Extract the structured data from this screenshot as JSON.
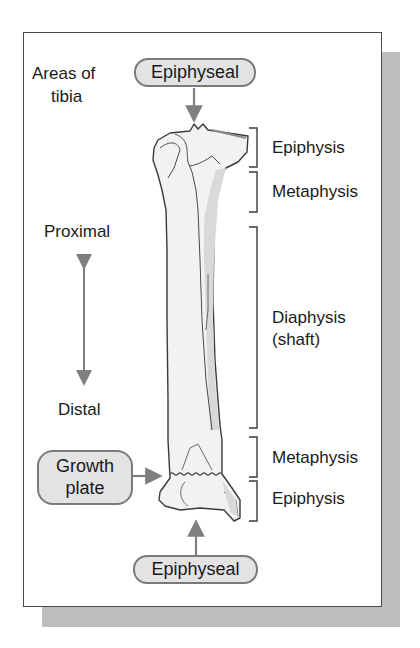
{
  "title_lines": [
    "Areas of",
    "tibia"
  ],
  "callouts": {
    "top": "Epiphyseal",
    "bottom": "Epiphyseal",
    "growth_plate_lines": [
      "Growth",
      "plate"
    ]
  },
  "direction": {
    "proximal": "Proximal",
    "distal": "Distal"
  },
  "regions": [
    {
      "label": "Epiphysis"
    },
    {
      "label": "Metaphysis"
    },
    {
      "label_lines": [
        "Diaphysis",
        "(shaft)"
      ]
    },
    {
      "label": "Metaphysis"
    },
    {
      "label": "Epiphysis"
    }
  ],
  "colors": {
    "bone_fill": "#f2f2f2",
    "bone_shade": "#d9d9d9",
    "outline": "#3a3a3a",
    "arrow": "#7f7f7f",
    "pill_fill": "#e3e3e3",
    "shadow": "#bdbdbd"
  }
}
